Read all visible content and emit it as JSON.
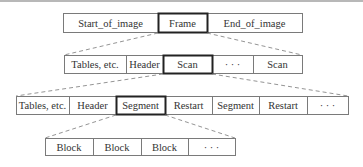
{
  "diagram": {
    "title": "",
    "rows": [
      {
        "level": "image",
        "cells": [
          {
            "label": "Start_of_image",
            "highlighted": false
          },
          {
            "label": "Frame",
            "highlighted": true
          },
          {
            "label": "End_of_image",
            "highlighted": false
          }
        ]
      },
      {
        "level": "frame",
        "cells": [
          {
            "label": "Tables, etc.",
            "highlighted": false
          },
          {
            "label": "Header",
            "highlighted": false
          },
          {
            "label": "Scan",
            "highlighted": true
          },
          {
            "label": "· · ·",
            "highlighted": false
          },
          {
            "label": "Scan",
            "highlighted": false
          }
        ]
      },
      {
        "level": "scan",
        "cells": [
          {
            "label": "Tables, etc.",
            "highlighted": false
          },
          {
            "label": "Header",
            "highlighted": false
          },
          {
            "label": "Segment",
            "highlighted": true
          },
          {
            "label": "Restart",
            "highlighted": false
          },
          {
            "label": "Segment",
            "highlighted": false
          },
          {
            "label": "Restart",
            "highlighted": false
          },
          {
            "label": "· · ·",
            "highlighted": false
          }
        ]
      },
      {
        "level": "segment",
        "cells": [
          {
            "label": "Block",
            "highlighted": false
          },
          {
            "label": "Block",
            "highlighted": false
          },
          {
            "label": "Block",
            "highlighted": false
          },
          {
            "label": "· · ·",
            "highlighted": false
          }
        ]
      }
    ],
    "expansions": [
      {
        "from": "Frame",
        "to_row": 1
      },
      {
        "from": "Scan",
        "to_row": 2
      },
      {
        "from": "Segment",
        "to_row": 3
      }
    ],
    "colors": {
      "border": "#7a7a7a",
      "highlight_border": "#222222",
      "dash": "#888888",
      "text": "#333333"
    }
  }
}
